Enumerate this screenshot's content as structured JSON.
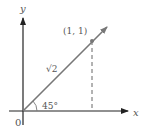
{
  "diagram": {
    "axes": {
      "x_label": "x",
      "y_label": "y",
      "origin_label": "0"
    },
    "point_label": "(1, 1)",
    "vector_length_label": "√2",
    "angle_label": "45°",
    "colors": {
      "axis": "#222222",
      "vector": "#777777",
      "text": "#555555",
      "dashed": "#666666"
    }
  }
}
